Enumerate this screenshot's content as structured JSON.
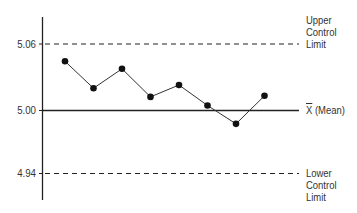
{
  "chart_data": {
    "type": "line",
    "title": "",
    "xlabel": "",
    "ylabel": "",
    "ylim": [
      4.915,
      5.1
    ],
    "grid": false,
    "x": [
      1,
      2,
      3,
      4,
      5,
      6,
      7,
      8
    ],
    "series": [
      {
        "name": "Sample means",
        "values": [
          5.044,
          5.019,
          5.037,
          5.011,
          5.022,
          5.003,
          4.986,
          5.012
        ]
      }
    ],
    "reference_lines": [
      {
        "name": "Upper Control Limit",
        "value": 5.06,
        "style": "dashed"
      },
      {
        "name": "X̄ (Mean)",
        "value": 5.0,
        "style": "solid"
      },
      {
        "name": "Lower Control Limit",
        "value": 4.94,
        "style": "dashed"
      }
    ],
    "yticks": [
      "5.06",
      "5.00",
      "4.94"
    ],
    "annotations": [
      "Upper Control Limit",
      "X̄ (Mean)",
      "Lower Control Limit"
    ]
  },
  "labels": {
    "ytick_ucl": "5.06",
    "ytick_mean": "5.00",
    "ytick_lcl": "4.94",
    "ucl_line1": "Upper",
    "ucl_line2": "Control",
    "ucl_line3": "Limit",
    "mean_symbol": "X",
    "mean_text": " (Mean)",
    "lcl_line1": "Lower",
    "lcl_line2": "Control",
    "lcl_line3": "Limit"
  },
  "colors": {
    "line": "#333333",
    "marker": "#111111",
    "axis": "#222222"
  }
}
